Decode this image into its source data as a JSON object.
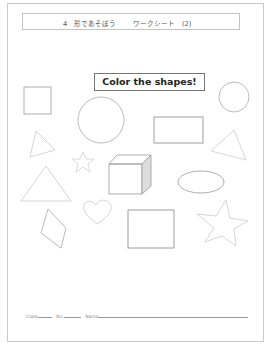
{
  "header": {
    "unit": "4　形であそぼう",
    "sheet": "ワークシート　(2)"
  },
  "banner": {
    "text": "Color the shapes!"
  },
  "shapes": [
    {
      "type": "square",
      "name": "square-small"
    },
    {
      "type": "circle",
      "name": "circle-large"
    },
    {
      "type": "circle",
      "name": "circle-small"
    },
    {
      "type": "rectangle",
      "name": "rectangle-top"
    },
    {
      "type": "triangle",
      "name": "triangle-left-small"
    },
    {
      "type": "triangle",
      "name": "triangle-right"
    },
    {
      "type": "star",
      "name": "star-small"
    },
    {
      "type": "cube",
      "name": "cube"
    },
    {
      "type": "triangle",
      "name": "triangle-large"
    },
    {
      "type": "ellipse",
      "name": "oval"
    },
    {
      "type": "heart",
      "name": "heart"
    },
    {
      "type": "diamond",
      "name": "rhombus"
    },
    {
      "type": "square",
      "name": "square-bottom"
    },
    {
      "type": "star",
      "name": "star-large"
    }
  ],
  "footer": {
    "class_label": "Class",
    "no_label": "No.",
    "name_label": "Name"
  },
  "colors": {
    "border": "#c8c8c8",
    "shape_stroke": "#9a9a9a",
    "shape_stroke_light": "#c8c8c8"
  }
}
